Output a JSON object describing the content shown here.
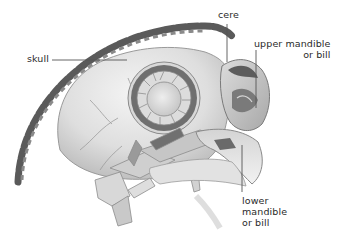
{
  "figure": {
    "labels": {
      "skull": {
        "lines": [
          "skull"
        ]
      },
      "cere": {
        "lines": [
          "cere"
        ]
      },
      "upper_mandible": {
        "lines": [
          "upper mandible",
          "or bill"
        ]
      },
      "lower_mandible": {
        "lines": [
          "lower",
          "mandible",
          "or bill"
        ]
      }
    }
  },
  "colors": {
    "background": "#ffffff",
    "label_text": "#2a2a2a",
    "leader_line": "#555555",
    "bone_light": "#e6e6e6",
    "bone_mid": "#bdbdbd",
    "bone_dark": "#6e6e6e",
    "feather_dark": "#4a4a4a"
  }
}
